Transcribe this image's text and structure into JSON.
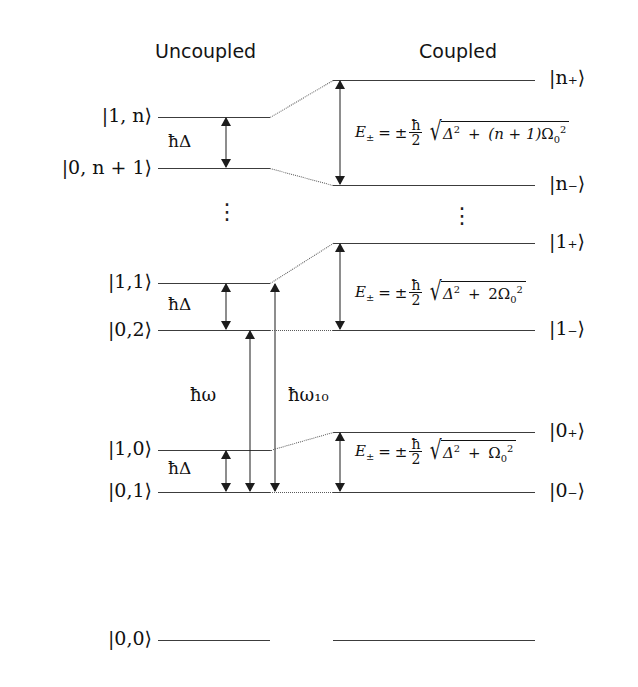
{
  "headers": {
    "uncoupled": "Uncoupled",
    "coupled": "Coupled"
  },
  "ellipsis_glyph": "⋮",
  "levels": {
    "uncoupled": [
      {
        "ket": "|1, n⟩",
        "y": 117
      },
      {
        "ket": "|0, n + 1⟩",
        "y": 168
      },
      {
        "ket": "|1,1⟩",
        "y": 283
      },
      {
        "ket": "|0,2⟩",
        "y": 330
      },
      {
        "ket": "|1,0⟩",
        "y": 450
      },
      {
        "ket": "|0,1⟩",
        "y": 492
      },
      {
        "ket": "|0,0⟩",
        "y": 640
      }
    ],
    "coupled": [
      {
        "ket": "|n₊⟩",
        "y": 80
      },
      {
        "ket": "|n₋⟩",
        "y": 185
      },
      {
        "ket": "|1₊⟩",
        "y": 243
      },
      {
        "ket": "|1₋⟩",
        "y": 330
      },
      {
        "ket": "|0₊⟩",
        "y": 432
      },
      {
        "ket": "|0₋⟩",
        "y": 492
      },
      {
        "ket": "",
        "y": 640
      }
    ]
  },
  "detuning_labels": {
    "n_group": "ħΔ",
    "one_group": "ħΔ",
    "zero_group": "ħΔ"
  },
  "transition_labels": {
    "photon": "ħω",
    "atomic": "ħω₁₀"
  },
  "formulas": {
    "n_group": {
      "lhs": "E",
      "pm": "±",
      "eq": "=",
      "sign": "±",
      "hbar": "ħ",
      "two": "2",
      "radicand_a": "Δ",
      "exp_a": "2",
      "plus": "+",
      "coef": "(n + 1)",
      "omega": "Ω",
      "omega_sub": "0",
      "exp_b": "2",
      "full": "E± = ±(ħ/2)√(Δ² + (n+1)Ω₀²)"
    },
    "one_group": {
      "lhs": "E",
      "pm": "±",
      "eq": "=",
      "sign": "±",
      "hbar": "ħ",
      "two": "2",
      "radicand_a": "Δ",
      "exp_a": "2",
      "plus": "+",
      "coef": "2",
      "omega": "Ω",
      "omega_sub": "0",
      "exp_b": "2",
      "full": "E± = ±(ħ/2)√(Δ² + 2Ω₀²)"
    },
    "zero_group": {
      "lhs": "E",
      "pm": "±",
      "eq": "=",
      "sign": "±",
      "hbar": "ħ",
      "two": "2",
      "radicand_a": "Δ",
      "exp_a": "2",
      "plus": "+",
      "coef": "",
      "omega": "Ω",
      "omega_sub": "0",
      "exp_b": "2",
      "full": "E± = ±(ħ/2)√(Δ² + Ω₀²)"
    }
  },
  "colors": {
    "ink": "#111111",
    "line": "#3c3c3c",
    "connector": "#5a5a5a",
    "background": "#ffffff"
  }
}
